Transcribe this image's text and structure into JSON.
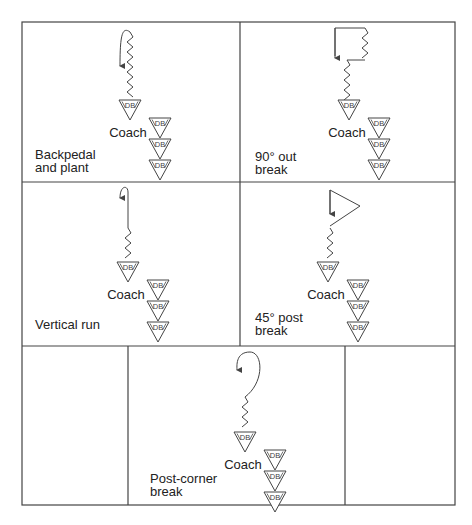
{
  "figure": {
    "frame": {
      "left": 22,
      "top": 22,
      "right": 455,
      "bottom": 505,
      "col_split": 240,
      "row1_bottom": 182,
      "row2_bottom": 346,
      "bottom_row_left_split": 128,
      "bottom_row_right_split": 345
    },
    "colors": {
      "line": "#444444",
      "text": "#222222",
      "background": "#ffffff"
    },
    "panels": [
      {
        "id": "backpedal-plant",
        "label": "Backpedal\nand plant",
        "label_x": 35,
        "label_y": 148,
        "route": "backpedal-plant",
        "ox": 130,
        "oy": 28
      },
      {
        "id": "ninety-out",
        "label": "90° out\nbreak",
        "label_x": 255,
        "label_y": 150,
        "route": "ninety-out",
        "ox": 355,
        "oy": 28
      },
      {
        "id": "vertical-run",
        "label": "Vertical run",
        "label_x": 35,
        "label_y": 318,
        "route": "vertical-run",
        "ox": 128,
        "oy": 188
      },
      {
        "id": "forty-five-post",
        "label": "45° post\nbreak",
        "label_x": 255,
        "label_y": 311,
        "route": "forty-five-post",
        "ox": 350,
        "oy": 188
      },
      {
        "id": "post-corner",
        "label": "Post-corner\nbreak",
        "label_x": 150,
        "label_y": 472,
        "route": "post-corner",
        "ox": 245,
        "oy": 352
      }
    ],
    "coach_label": "Coach",
    "db_label": "DB"
  }
}
